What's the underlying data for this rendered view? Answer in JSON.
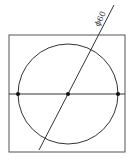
{
  "diagram": {
    "type": "technical-drawing",
    "dimension_label": "ϕ60",
    "stroke_color": "#333333",
    "background": "#ffffff",
    "square": {
      "x": 9,
      "y": 35,
      "width": 116,
      "height": 117
    },
    "circle": {
      "cx": 68,
      "cy": 94,
      "r": 50
    },
    "horizontal_line": {
      "x1": 9,
      "y1": 94,
      "x2": 125,
      "y2": 94
    },
    "diagonal_line": {
      "x1": 114,
      "y1": 5,
      "x2": 39,
      "y2": 150
    },
    "points": [
      {
        "name": "left",
        "x": 18,
        "y": 94
      },
      {
        "name": "center",
        "x": 68,
        "y": 94
      },
      {
        "name": "right",
        "x": 118,
        "y": 94
      }
    ]
  }
}
